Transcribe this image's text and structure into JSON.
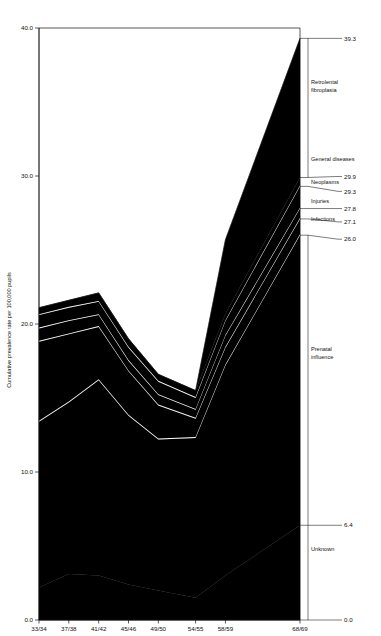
{
  "chart_data": {
    "type": "area",
    "title": "",
    "xlabel": "",
    "ylabel": "Cumulative prevalence rate per 100,000 pupils",
    "ylim": [
      0.0,
      40.0
    ],
    "grid": false,
    "legend_position": "right-inline-labels",
    "categories": [
      "33/34",
      "37/38",
      "41/42",
      "45/46",
      "49/50",
      "54/55",
      "58/59",
      "68/69"
    ],
    "y_ticks": [
      "0.0",
      "10.0",
      "20.0",
      "30.0",
      "40.0"
    ],
    "y_tick_values": [
      0.0,
      10.0,
      20.0,
      30.0,
      40.0
    ],
    "stack_order_bottom_to_top": [
      "Unknown",
      "Prenatal influence",
      "Infections",
      "Injuries",
      "Neoplasms",
      "General diseases",
      "Retrolental fibroplasia"
    ],
    "series": [
      {
        "name": "Unknown",
        "values": [
          2.2,
          3.1,
          3.0,
          2.4,
          2.0,
          1.5,
          3.0,
          6.4
        ]
      },
      {
        "name": "Prenatal influence",
        "values": [
          11.2,
          11.6,
          13.2,
          11.4,
          10.2,
          10.8,
          14.2,
          19.6
        ]
      },
      {
        "name": "Infections",
        "values": [
          5.4,
          4.6,
          3.6,
          3.0,
          2.3,
          1.3,
          1.2,
          1.1
        ]
      },
      {
        "name": "Injuries",
        "values": [
          0.9,
          0.9,
          0.8,
          0.7,
          0.7,
          0.6,
          0.8,
          1.1
        ]
      },
      {
        "name": "Neoplasms",
        "values": [
          0.9,
          0.9,
          0.9,
          0.9,
          0.9,
          0.8,
          1.0,
          1.5
        ]
      },
      {
        "name": "General diseases",
        "values": [
          0.5,
          0.5,
          0.6,
          0.6,
          0.5,
          0.5,
          0.5,
          0.6
        ]
      },
      {
        "name": "Retrolental fibroplasia",
        "values": [
          0.0,
          0.0,
          0.0,
          0.0,
          0.0,
          0.0,
          5.0,
          9.4
        ]
      }
    ],
    "cumulative_boundaries": {
      "unknown_top": [
        2.2,
        3.1,
        3.0,
        2.4,
        2.0,
        1.5,
        3.0,
        6.4
      ],
      "prenatal_top": [
        13.4,
        14.7,
        16.2,
        13.8,
        12.2,
        12.3,
        17.2,
        26.0
      ],
      "infections_top": [
        18.8,
        19.3,
        19.8,
        16.8,
        14.5,
        13.6,
        18.4,
        27.1
      ],
      "injuries_top": [
        19.7,
        20.2,
        20.6,
        17.5,
        15.2,
        14.2,
        19.2,
        27.8
      ],
      "neoplasms_top": [
        20.6,
        21.1,
        21.5,
        18.4,
        16.1,
        15.0,
        20.2,
        29.3
      ],
      "general_diseases_top": [
        21.1,
        21.6,
        22.1,
        19.0,
        16.6,
        15.5,
        20.7,
        29.9
      ],
      "total_top": [
        21.1,
        21.6,
        22.1,
        19.0,
        16.6,
        15.5,
        25.7,
        39.3
      ]
    },
    "right_value_labels": [
      {
        "label": "39.3",
        "value": 39.3,
        "series": "Retrolental fibroplasia top"
      },
      {
        "label": "29.9",
        "value": 29.9,
        "series": "General diseases top"
      },
      {
        "label": "29.3",
        "value": 29.3,
        "series": "Neoplasms top"
      },
      {
        "label": "27.8",
        "value": 27.8,
        "series": "Injuries top"
      },
      {
        "label": "27.1",
        "value": 27.1,
        "series": "Infections top"
      },
      {
        "label": "26.0",
        "value": 26.0,
        "series": "Prenatal influence top"
      },
      {
        "label": "6.4",
        "value": 6.4,
        "series": "Unknown top"
      },
      {
        "label": "0.0",
        "value": 0.0,
        "series": "baseline"
      }
    ],
    "band_annotations": [
      {
        "label": "Retrolental fibroplasia",
        "lines": [
          "Retrolental",
          "fibroplasia"
        ]
      },
      {
        "label": "General diseases",
        "lines": [
          "General diseases"
        ]
      },
      {
        "label": "Neoplasms",
        "lines": [
          "Neoplasms"
        ]
      },
      {
        "label": "Injuries",
        "lines": [
          "Injuries"
        ]
      },
      {
        "label": "Infections",
        "lines": [
          "Infections"
        ]
      },
      {
        "label": "Prenatal influence",
        "lines": [
          "Prenatal",
          "influence"
        ]
      },
      {
        "label": "Unknown",
        "lines": [
          "Unknown"
        ]
      }
    ]
  },
  "axis": {
    "y_title": "Cumulative prevalence rate per 100,000 pupils",
    "y_tick_40": "40.0",
    "y_tick_30": "30.0",
    "y_tick_20": "20.0",
    "y_tick_10": "10.0",
    "y_tick_0": "0.0"
  },
  "xticks": {
    "t0": "33/34",
    "t1": "37/38",
    "t2": "41/42",
    "t3": "45/46",
    "t4": "49/50",
    "t5": "54/55",
    "t6": "58/59",
    "t7": "68/69"
  },
  "rightlabels": {
    "v39_3": "39.3",
    "v29_9": "29.9",
    "v29_3": "29.3",
    "v27_8": "27.8",
    "v27_1": "27.1",
    "v26_0": "26.0",
    "v6_4": "6.4",
    "v0_0": "0.0"
  },
  "bands": {
    "rlf_line1": "Retrolental",
    "rlf_line2": "fibroplasia",
    "general": "General diseases",
    "neoplasms": "Neoplasms",
    "injuries": "Injuries",
    "infections": "Infections",
    "prenatal_line1": "Prenatal",
    "prenatal_line2": "influence",
    "unknown": "Unknown"
  },
  "colors": {
    "area": "#000000",
    "axis": "#111111",
    "background": "#ffffff"
  }
}
